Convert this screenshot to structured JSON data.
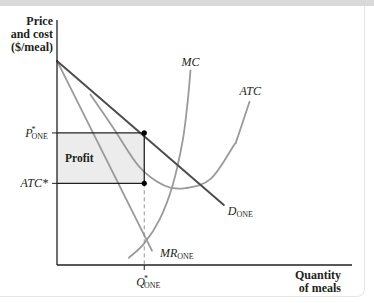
{
  "chart_data": {
    "type": "line",
    "title": "",
    "ylabel": [
      "Price",
      "and cost",
      "($/meal)"
    ],
    "xlabel": [
      "Quantity",
      "of meals"
    ],
    "x_range": [
      0,
      10
    ],
    "y_range": [
      0,
      10
    ],
    "grid": false,
    "series": [
      {
        "name": "D_ONE",
        "label_main": "D",
        "label_sub": "ONE",
        "style": "dark",
        "points": [
          [
            0,
            8.5
          ],
          [
            6.5,
            2.5
          ]
        ]
      },
      {
        "name": "MR_ONE",
        "label_main": "MR",
        "label_sub": "ONE",
        "style": "light",
        "points": [
          [
            0,
            8.5
          ],
          [
            3.7,
            0.6
          ]
        ]
      },
      {
        "name": "MC",
        "label_main": "MC",
        "label_sub": "",
        "style": "light",
        "points": [
          [
            2.8,
            0.3
          ],
          [
            3.4,
            0.9
          ],
          [
            4.0,
            1.9
          ],
          [
            4.5,
            3.3
          ],
          [
            4.9,
            5.2
          ],
          [
            5.1,
            6.9
          ],
          [
            5.2,
            8.1
          ]
        ]
      },
      {
        "name": "ATC",
        "label_main": "ATC",
        "label_sub": "",
        "style": "light",
        "points": [
          [
            1.3,
            7.1
          ],
          [
            2.2,
            5.7
          ],
          [
            3.2,
            4.1
          ],
          [
            4.2,
            3.3
          ],
          [
            5.0,
            3.2
          ],
          [
            6.0,
            3.6
          ],
          [
            6.9,
            5.0
          ],
          [
            7.0,
            5.2
          ],
          [
            7.5,
            6.8
          ]
        ]
      }
    ],
    "equilibrium": {
      "q_label_main": "Q",
      "q_label_sup": "*",
      "q_label_sub": "ONE",
      "p_label_main": "P",
      "p_label_sup": "*",
      "p_label_sub": "ONE",
      "atc_label": "ATC*",
      "q": 3.4,
      "p": 5.5,
      "atc": 3.4
    },
    "profit_region": {
      "label": "Profit",
      "fill": "#ececec"
    },
    "colors": {
      "dark": "#4d4d4f",
      "light": "#9a9a9a",
      "axis": "#231f20",
      "background": "#ffffff",
      "topbar": "#d9d9d9"
    }
  }
}
